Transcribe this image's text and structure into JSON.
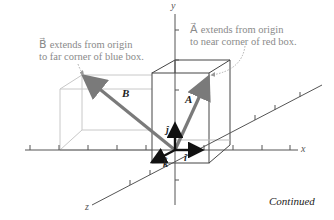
{
  "annotations": {
    "b_note_line1": "B⃗ extends from origin",
    "b_note_line2": "to far corner of blue box.",
    "a_note_line1": "A⃗ extends from origin",
    "a_note_line2": "to near corner of red box."
  },
  "axes": {
    "x": "x",
    "y": "y",
    "z": "z"
  },
  "vectors": {
    "A": "A⃗",
    "B": "B⃗"
  },
  "unit_vectors": {
    "i": "î",
    "j": "ĵ",
    "k": "k̂"
  },
  "footer": {
    "continued": "Continued"
  },
  "colors": {
    "axis": "#555555",
    "vector": "#7a7a7a",
    "unit_vector": "#111111",
    "red_box": "#444444",
    "blue_box": "#c8c8c8",
    "note_text": "#8a8a8a"
  }
}
